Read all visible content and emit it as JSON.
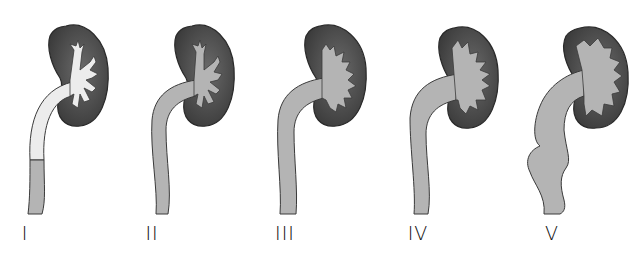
{
  "colors": {
    "cortex": "#4a4a4a",
    "cortex_edge": "#2a2a2a",
    "collecting_system": "#b4b4b4",
    "ureter_grade1_upper": "#ececec",
    "outline": "#3a3a3a",
    "background": "#ffffff"
  },
  "grades": [
    {
      "label": "I",
      "x": 25
    },
    {
      "label": "II",
      "x": 152
    },
    {
      "label": "III",
      "x": 285
    },
    {
      "label": "IV",
      "x": 418
    },
    {
      "label": "V",
      "x": 552
    }
  ]
}
